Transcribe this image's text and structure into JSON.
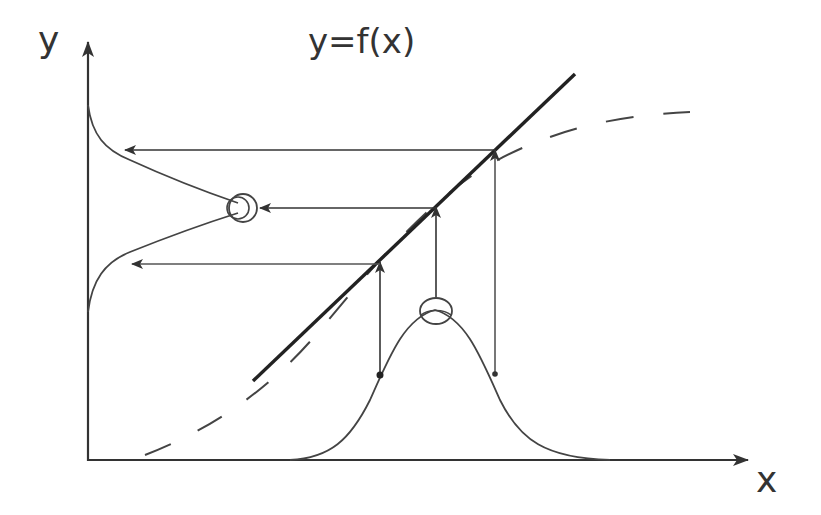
{
  "diagram": {
    "title": "y=f(x)",
    "axes": {
      "x_label": "x",
      "y_label": "y"
    },
    "colors": {
      "background": "#ffffff",
      "ink": "#333333",
      "thin_line": "#555555"
    },
    "elements": [
      {
        "name": "transfer-line",
        "kind": "solid-straight-line",
        "description": "linear approximation of y=f(x)"
      },
      {
        "name": "transfer-curve",
        "kind": "dashed-curve",
        "description": "nonlinear function y=f(x)"
      },
      {
        "name": "input-distribution",
        "kind": "bell-curve",
        "axis": "x"
      },
      {
        "name": "output-distribution",
        "kind": "bell-curve",
        "axis": "y"
      },
      {
        "name": "projection-arrows",
        "kind": "arrows",
        "count_vertical": 3,
        "count_horizontal": 3
      }
    ]
  }
}
